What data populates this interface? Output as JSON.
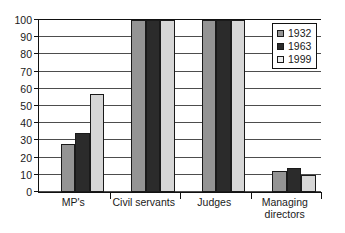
{
  "chart_data": {
    "type": "bar",
    "title": "",
    "subtitle": "",
    "xlabel": "",
    "ylabel": "",
    "categories": [
      "MP's",
      "Civil servants",
      "Judges",
      "Managing directors"
    ],
    "series": [
      {
        "name": "1932",
        "color": "#949494",
        "values": [
          28,
          100,
          100,
          12.5
        ]
      },
      {
        "name": "1963",
        "color": "#2b2b2b",
        "values": [
          34.5,
          100,
          100,
          14
        ]
      },
      {
        "name": "1999",
        "color": "#d6d6d6",
        "values": [
          57,
          100,
          100,
          10
        ]
      }
    ],
    "ylim": [
      0,
      100
    ],
    "ytick_step": 10,
    "yticks": [
      0,
      10,
      20,
      30,
      40,
      50,
      60,
      70,
      80,
      90,
      100
    ],
    "ytick_labels": [
      "0",
      "10",
      "20",
      "30",
      "40",
      "50",
      "60",
      "70",
      "80",
      "90",
      "100"
    ],
    "grid": true,
    "grid_axis": "y",
    "legend": {
      "position": "top-right",
      "entries": [
        "1932",
        "1963",
        "1999"
      ]
    }
  },
  "category_labels": [
    {
      "line1": "MP's",
      "line2": ""
    },
    {
      "line1": "Civil servants",
      "line2": ""
    },
    {
      "line1": "Judges",
      "line2": ""
    },
    {
      "line1": "Managing",
      "line2": "directors"
    }
  ]
}
